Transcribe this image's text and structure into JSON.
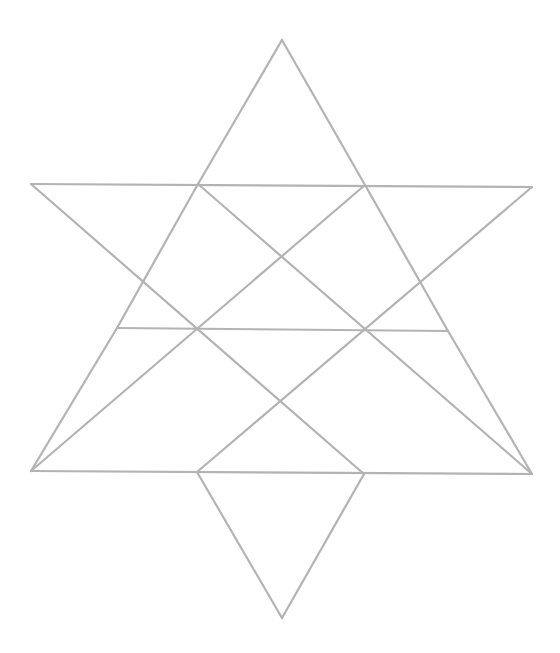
{
  "diagram": {
    "title": "",
    "stroke_color": "#b3b3b3",
    "stroke_width": 2.2,
    "background": "#ffffff",
    "vertices": {
      "top": [
        282,
        40
      ],
      "bottom": [
        282,
        618
      ],
      "upper_left_outer": [
        31,
        184
      ],
      "upper_right_outer": [
        532,
        187
      ],
      "upper_inner_left": [
        198,
        184
      ],
      "upper_inner_right": [
        365,
        185
      ],
      "mid_left": [
        117,
        328
      ],
      "mid_center": [
        282,
        329
      ],
      "mid_right": [
        448,
        331
      ],
      "lower_left_outer": [
        31,
        471
      ],
      "lower_right_outer": [
        532,
        474
      ],
      "lower_inner_left": [
        197,
        472
      ],
      "lower_inner_right": [
        364,
        474
      ]
    },
    "segments": [
      {
        "name": "upper-horizontal",
        "from": "upper_left_outer",
        "to": "upper_right_outer"
      },
      {
        "name": "middle-horizontal",
        "from": "mid_left",
        "to": "mid_right"
      },
      {
        "name": "lower-horizontal",
        "from": "lower_left_outer",
        "to": "lower_right_outer"
      },
      {
        "name": "top-left-edge",
        "from": "top",
        "to": "upper_inner_left"
      },
      {
        "name": "top-right-edge",
        "from": "top",
        "to": "upper_inner_right"
      },
      {
        "name": "diag-a",
        "from": "upper_left_outer",
        "to": "lower_inner_right"
      },
      {
        "name": "diag-b",
        "from": "upper_right_outer",
        "to": "lower_inner_left"
      },
      {
        "name": "diag-c",
        "from": "upper_inner_left",
        "to": "lower_right_outer"
      },
      {
        "name": "diag-d",
        "from": "upper_inner_right",
        "to": "lower_left_outer"
      },
      {
        "name": "diag-e",
        "from": "upper_inner_left",
        "to": "mid_left"
      },
      {
        "name": "diag-f",
        "from": "upper_inner_right",
        "to": "mid_right"
      },
      {
        "name": "bottom-left-edge",
        "from": "lower_inner_left",
        "to": "bottom"
      },
      {
        "name": "bottom-right-edge",
        "from": "lower_inner_right",
        "to": "bottom"
      },
      {
        "name": "left-lower-edge",
        "from": "mid_left",
        "to": "lower_left_outer"
      },
      {
        "name": "right-lower-edge",
        "from": "mid_right",
        "to": "lower_right_outer"
      }
    ],
    "triangle_count": 12
  }
}
